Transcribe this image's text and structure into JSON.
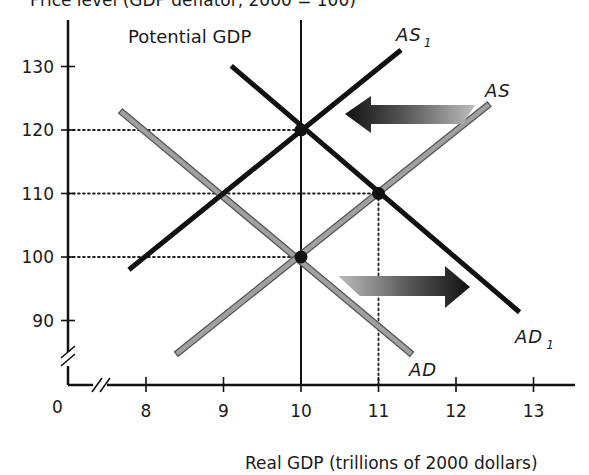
{
  "chart_data": {
    "type": "line",
    "title": "",
    "ylabel": "Price level (GDP deflator, 2000 = 100)",
    "xlabel": "Real GDP (trillions of 2000 dollars)",
    "origin_label": "0",
    "x_ticks": [
      8,
      9,
      10,
      11,
      12,
      13
    ],
    "y_ticks": [
      90,
      100,
      110,
      120,
      130
    ],
    "xlim": [
      7.0,
      13.5
    ],
    "ylim": [
      80,
      135
    ],
    "axis_breaks": {
      "x": true,
      "y": true
    },
    "grid": false,
    "potential_gdp": {
      "label": "Potential GDP",
      "x": 10
    },
    "series": [
      {
        "name": "AD",
        "label_main": "AD",
        "label_sub": "",
        "color": "#a0a0a0",
        "style": "gray-outlined",
        "points": [
          [
            7.7,
            122.7
          ],
          [
            11.4,
            85.0
          ]
        ]
      },
      {
        "name": "AS",
        "label_main": "AS",
        "label_sub": "",
        "color": "#a0a0a0",
        "style": "gray-outlined",
        "points": [
          [
            8.42,
            85.0
          ],
          [
            12.4,
            123.8
          ]
        ]
      },
      {
        "name": "AS1",
        "label_main": "AS",
        "label_sub": "1",
        "color": "#111111",
        "style": "solid",
        "points": [
          [
            7.78,
            98.0
          ],
          [
            11.29,
            132.6
          ]
        ]
      },
      {
        "name": "AD1",
        "label_main": "AD",
        "label_sub": "1",
        "color": "#111111",
        "style": "solid",
        "points": [
          [
            9.1,
            130.1
          ],
          [
            12.82,
            91.3
          ]
        ]
      }
    ],
    "equilibrium_points": [
      {
        "x": 10,
        "y": 100,
        "desc": "AD ∩ AS at potential GDP"
      },
      {
        "x": 11,
        "y": 110,
        "desc": "AD1 ∩ AS"
      },
      {
        "x": 10,
        "y": 120,
        "desc": "AD1 ∩ AS1 at potential GDP"
      }
    ],
    "reference_lines": [
      {
        "type": "h",
        "y": 120,
        "to_x": 10
      },
      {
        "type": "h",
        "y": 110,
        "to_x": 11
      },
      {
        "type": "h",
        "y": 100,
        "to_x": 10
      },
      {
        "type": "v",
        "x": 11,
        "from_y": 110
      }
    ],
    "annotations": [
      {
        "type": "arrow",
        "direction": "left",
        "desc": "AS shifts left to AS1"
      },
      {
        "type": "arrow",
        "direction": "right",
        "desc": "AD shifts right to AD1"
      }
    ]
  }
}
